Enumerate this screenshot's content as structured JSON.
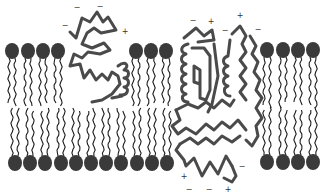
{
  "diagram": {
    "type": "phospholipid bilayer with membrane proteins",
    "colors": {
      "lipid_head": "#3a3a3a",
      "lipid_tail": "#1e1e1e",
      "protein_outline": "#4a4a4a",
      "charge_text": "#333333",
      "background": "#ffffff"
    },
    "upper_leaflet_heads": [
      {
        "x": 12,
        "y": 51
      },
      {
        "x": 28,
        "y": 51
      },
      {
        "x": 43,
        "y": 51
      },
      {
        "x": 58,
        "y": 51
      },
      {
        "x": 136,
        "y": 51
      },
      {
        "x": 151,
        "y": 51
      },
      {
        "x": 166,
        "y": 51
      },
      {
        "x": 267,
        "y": 50
      },
      {
        "x": 283,
        "y": 50
      },
      {
        "x": 298,
        "y": 50
      },
      {
        "x": 313,
        "y": 50
      }
    ],
    "lower_leaflet_heads": [
      {
        "x": 15,
        "y": 163
      },
      {
        "x": 30,
        "y": 163
      },
      {
        "x": 45,
        "y": 163
      },
      {
        "x": 61,
        "y": 163
      },
      {
        "x": 76,
        "y": 163
      },
      {
        "x": 91,
        "y": 163
      },
      {
        "x": 106,
        "y": 163
      },
      {
        "x": 121,
        "y": 163
      },
      {
        "x": 137,
        "y": 163
      },
      {
        "x": 152,
        "y": 163
      },
      {
        "x": 167,
        "y": 163
      },
      {
        "x": 267,
        "y": 162
      },
      {
        "x": 283,
        "y": 162
      },
      {
        "x": 298,
        "y": 162
      },
      {
        "x": 313,
        "y": 162
      }
    ],
    "proteins": [
      {
        "name": "peripheral-protein",
        "position": "upper leaflet, partially embedded"
      },
      {
        "name": "transmembrane-protein",
        "position": "spans bilayer"
      }
    ],
    "charges": [
      {
        "symbol": "−",
        "x": 77,
        "y": 8
      },
      {
        "symbol": "−",
        "x": 100,
        "y": 7
      },
      {
        "symbol": "−",
        "x": 65,
        "y": 26
      },
      {
        "symbol": "+",
        "x": 125,
        "y": 32
      },
      {
        "symbol": "−",
        "x": 193,
        "y": 21
      },
      {
        "symbol": "+",
        "x": 211,
        "y": 22
      },
      {
        "symbol": "−",
        "x": 225,
        "y": 31
      },
      {
        "symbol": "+",
        "x": 240,
        "y": 16
      },
      {
        "symbol": "−",
        "x": 258,
        "y": 30
      },
      {
        "symbol": "+",
        "x": 184,
        "y": 177
      },
      {
        "symbol": "−",
        "x": 242,
        "y": 167
      },
      {
        "symbol": "−",
        "x": 189,
        "y": 190
      },
      {
        "symbol": "−",
        "x": 209,
        "y": 190
      },
      {
        "symbol": "+",
        "x": 228,
        "y": 190
      }
    ]
  }
}
